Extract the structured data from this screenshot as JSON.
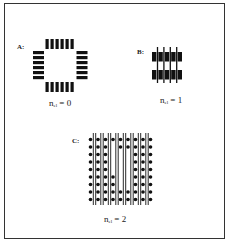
{
  "figure": {
    "panels": [
      {
        "id": "A",
        "label": "A:",
        "equation_base": "n",
        "equation_sub": "el",
        "equation_rhs": "= 0",
        "description": "ring of 24 pads: 6 per side, open center"
      },
      {
        "id": "B",
        "label": "B:",
        "equation_base": "n",
        "equation_sub": "el",
        "equation_rhs": "= 1",
        "description": "2 rows x 5 pads with 4 vertical lines routed between pads"
      },
      {
        "id": "C",
        "label": "C:",
        "equation_base": "n",
        "equation_sub": "el",
        "equation_rhs": "= 2",
        "description": "9x9 dot array with 8 double-line vertical channels; central dots removed"
      }
    ],
    "colors": {
      "ink": "#111111",
      "border": "#333333",
      "background": "#ffffff"
    }
  }
}
